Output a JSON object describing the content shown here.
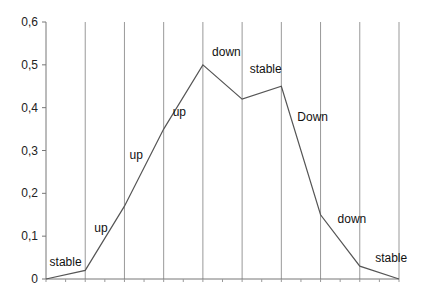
{
  "chart_data": {
    "type": "line",
    "title": "",
    "xlabel": "",
    "ylabel": "",
    "ylim": [
      0,
      0.6
    ],
    "grid": {
      "vertical": true,
      "horizontal": false
    },
    "legend": null,
    "x": [
      0,
      1,
      2,
      3,
      4,
      5,
      6,
      7,
      8,
      9
    ],
    "values": [
      0,
      0.02,
      0.17,
      0.35,
      0.5,
      0.42,
      0.45,
      0.15,
      0.03,
      0
    ],
    "yticks": [
      "0",
      "0,1",
      "0,2",
      "0,3",
      "0,4",
      "0,5",
      "0,6"
    ],
    "annotations": [
      {
        "text": "stable",
        "x": 0.5,
        "y": 0.03
      },
      {
        "text": "up",
        "x": 1.4,
        "y": 0.11
      },
      {
        "text": "up",
        "x": 2.3,
        "y": 0.28
      },
      {
        "text": "up",
        "x": 3.4,
        "y": 0.38
      },
      {
        "text": "down",
        "x": 4.6,
        "y": 0.52
      },
      {
        "text": "stable",
        "x": 5.6,
        "y": 0.48
      },
      {
        "text": "Down",
        "x": 6.8,
        "y": 0.37
      },
      {
        "text": "down",
        "x": 7.8,
        "y": 0.13
      },
      {
        "text": "stable",
        "x": 8.8,
        "y": 0.04
      }
    ],
    "line_color": "#555555",
    "grid_color": "#999999"
  }
}
